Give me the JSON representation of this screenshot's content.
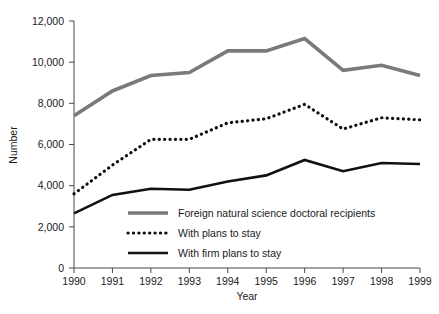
{
  "chart_data": {
    "type": "line",
    "title": "",
    "xlabel": "Year",
    "ylabel": "Number",
    "x": [
      1990,
      1991,
      1992,
      1993,
      1994,
      1995,
      1996,
      1997,
      1998,
      1999
    ],
    "categories": [
      "1990",
      "1991",
      "1992",
      "1993",
      "1994",
      "1995",
      "1996",
      "1997",
      "1998",
      "1999"
    ],
    "xlim": [
      1990,
      1999
    ],
    "ylim": [
      0,
      12000
    ],
    "yticks": [
      0,
      2000,
      4000,
      6000,
      8000,
      10000,
      12000
    ],
    "ytick_labels": [
      "0",
      "2,000",
      "4,000",
      "6,000",
      "8,000",
      "10,000",
      "12,000"
    ],
    "grid": false,
    "legend_position": "inside-bottom-left",
    "series": [
      {
        "name": "Foreign natural science doctoral recipients",
        "style": "solid-thick-gray",
        "color": "#7a7a7a",
        "values": [
          7400,
          8600,
          9350,
          9500,
          10550,
          10550,
          11150,
          9600,
          9850,
          9350
        ]
      },
      {
        "name": "With plans to stay",
        "style": "dotted-black",
        "color": "#111111",
        "values": [
          3600,
          5000,
          6250,
          6250,
          7050,
          7250,
          7950,
          6750,
          7300,
          7200
        ]
      },
      {
        "name": "With firm plans to stay",
        "style": "solid-black",
        "color": "#111111",
        "values": [
          2650,
          3550,
          3850,
          3800,
          4200,
          4500,
          5250,
          4700,
          5100,
          5050
        ]
      }
    ]
  },
  "legend": {
    "items": [
      {
        "label": "Foreign natural science doctoral recipients",
        "swatch": "thick-gray-line"
      },
      {
        "label": "With plans to stay",
        "swatch": "dotted-black-line"
      },
      {
        "label": "With firm plans to stay",
        "swatch": "solid-black-line"
      }
    ]
  }
}
